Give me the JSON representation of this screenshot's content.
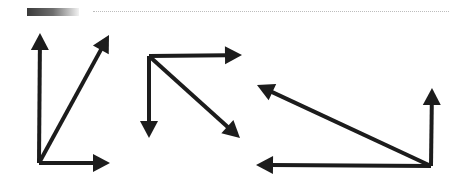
{
  "header": {
    "accent_bar_colors": [
      "#3a3a3a",
      "#f2f2f2"
    ],
    "rule_style": "dotted"
  },
  "diagram": {
    "stroke_color": "#1c1c1c",
    "groups": [
      {
        "name": "vector-group-1",
        "origin": [
          39,
          163
        ],
        "vectors": [
          {
            "name": "up",
            "tip": [
              40,
              33
            ]
          },
          {
            "name": "diagonal-up-right",
            "tip": [
              109,
              35
            ]
          },
          {
            "name": "right",
            "tip": [
              110,
              163
            ]
          }
        ]
      },
      {
        "name": "vector-group-2",
        "origin": [
          149,
          56
        ],
        "vectors": [
          {
            "name": "right",
            "tip": [
              242,
              55
            ]
          },
          {
            "name": "down",
            "tip": [
              149,
              138
            ]
          },
          {
            "name": "diagonal-down-right",
            "tip": [
              240,
              138
            ]
          }
        ]
      },
      {
        "name": "vector-group-3",
        "origin": [
          431,
          166
        ],
        "vectors": [
          {
            "name": "up",
            "tip": [
              432,
              88
            ]
          },
          {
            "name": "diagonal-up-left",
            "tip": [
              257,
              85
            ]
          },
          {
            "name": "left",
            "tip": [
              256,
              165
            ]
          }
        ]
      }
    ]
  }
}
